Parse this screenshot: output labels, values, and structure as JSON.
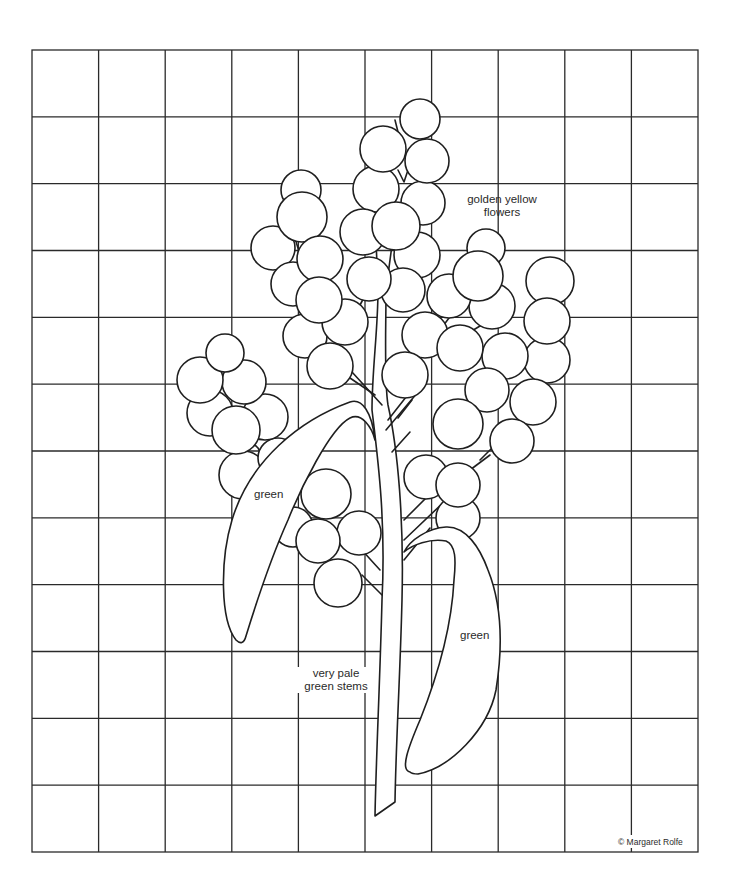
{
  "diagram": {
    "type": "embroidery-pattern-grid",
    "grid": {
      "columns": 10,
      "rows": 12
    },
    "labels": {
      "flowers_line1": "golden yellow",
      "flowers_line2": "flowers",
      "left_leaf": "green",
      "right_leaf": "green",
      "stems_line1": "very pale",
      "stems_line2": "green stems"
    },
    "copyright": "© Margaret Rolfe",
    "colors": {
      "line": "#1f1f1f",
      "background": "#ffffff"
    }
  }
}
